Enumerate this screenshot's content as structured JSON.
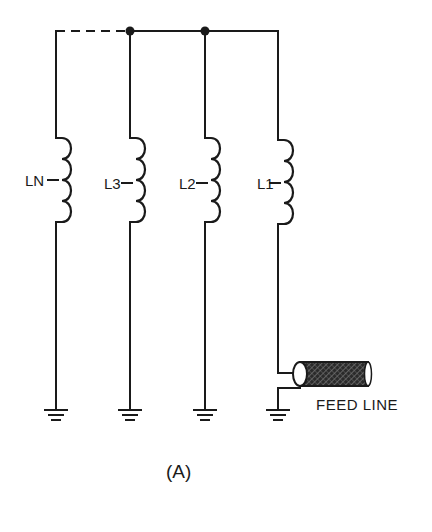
{
  "diagram": {
    "caption": "(A)",
    "feed_line_label": "FEED LINE",
    "inductors": [
      {
        "label": "LN",
        "x": 56
      },
      {
        "label": "L3",
        "x": 130
      },
      {
        "label": "L2",
        "x": 205
      },
      {
        "label": "L1",
        "x": 278
      }
    ],
    "top_bus": {
      "y": 31,
      "dashed_segment": {
        "from": "LN",
        "to": "L3"
      },
      "junctions": [
        "L3",
        "L2"
      ]
    },
    "ground_symbols": 4,
    "colors": {
      "ink": "#1a1a1a",
      "background": "#ffffff"
    }
  }
}
